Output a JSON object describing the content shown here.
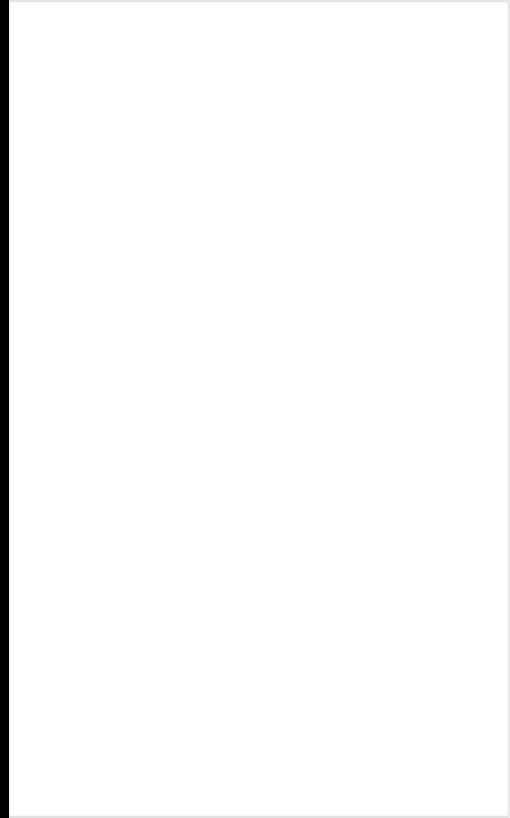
{
  "window": {
    "background": "#ffffff",
    "left_edge_color": "#000000",
    "border_color": "#e6e6e6"
  },
  "content": {
    "texts": []
  }
}
